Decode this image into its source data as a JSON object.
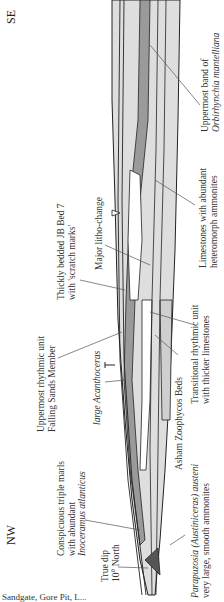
{
  "diagram": {
    "orientation": "rotated-90-ccw",
    "directions": {
      "top": "SE",
      "bottom": "NW"
    },
    "labels": [
      {
        "id": "orbirhynchia",
        "line1": "Uppermost band of",
        "line2": "Orbirhynchia mantelliana"
      },
      {
        "id": "heteromorph",
        "line1": "Limestones with abundant",
        "line2": "heteromorph ammonites"
      },
      {
        "id": "litho-change",
        "line1": "Major litho-change"
      },
      {
        "id": "jb-bed-7",
        "line1": "Thickly bedded JB Bed 7",
        "line2": "with 'scratch marks'"
      },
      {
        "id": "falling-sands",
        "line1": "Uppermost rhythmic unit",
        "line2": "Falling Sands Member"
      },
      {
        "id": "acanthoceras",
        "line1": "large Acanthoceras"
      },
      {
        "id": "transitional",
        "line1": "Transitional rhythmic unit",
        "line2": "with thicker limestones"
      },
      {
        "id": "zoophycos",
        "line1": "Asham Zoophycos Beds"
      },
      {
        "id": "triple-marls",
        "line1": "Conspicuous triple marls",
        "line2": "with abundant",
        "line3": "Inoceramus atlanticus"
      },
      {
        "id": "true-dip",
        "line1": "True dip",
        "line2": "10° North"
      },
      {
        "id": "parapuzosia",
        "line1": "Parapuzosia (Austiniceras) austeni",
        "line2": "very large, smooth ammonites"
      }
    ],
    "caption": "Sandgate, Gore Pit, L..."
  },
  "colors": {
    "dark_band": "#9a9a9a",
    "light_band": "#d9d9d9",
    "ink": "#222222",
    "leader": "#555555"
  }
}
